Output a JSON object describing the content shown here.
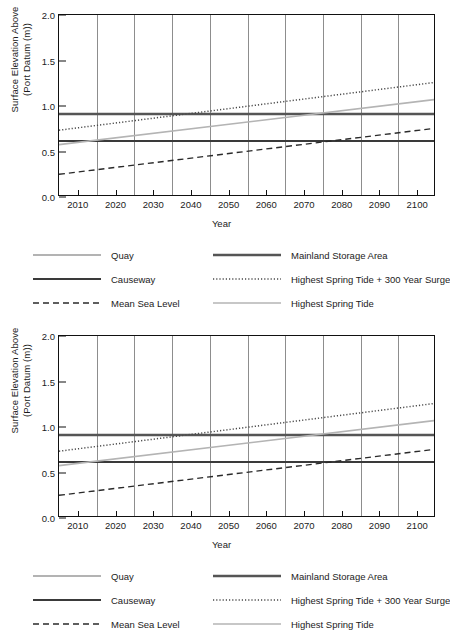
{
  "chart_data": {
    "type": "line",
    "title": "",
    "xlabel": "Year",
    "ylabel": "Surface Elevation Above (Port Datum (m))",
    "ylabel_line1": "Surface Elevation Above",
    "ylabel_line2": "(Port Datum (m))",
    "xlim": [
      2005,
      2105
    ],
    "ylim": [
      0.0,
      2.0
    ],
    "grid": "vertical gridlines at mid-decades",
    "legend_position": "below plot, 3 rows x 2 columns",
    "xticks": [
      2010,
      2020,
      2030,
      2040,
      2050,
      2060,
      2070,
      2080,
      2090,
      2100
    ],
    "xtick_labels": [
      "2010",
      "2020",
      "2030",
      "2040",
      "2050",
      "2060",
      "2070",
      "2080",
      "2090",
      "2100"
    ],
    "yticks": [
      0.0,
      0.5,
      1.0,
      1.5,
      2.0
    ],
    "ytick_labels": [
      "0.0",
      "0.5",
      "1.0",
      "1.5",
      "2.0"
    ],
    "gridlines_x": [
      2015,
      2025,
      2035,
      2045,
      2055,
      2065,
      2075,
      2085,
      2095
    ],
    "series": [
      {
        "name": "Quay",
        "style": "solid",
        "color": "#9a9a9a",
        "width": 1.6,
        "x": [
          2005,
          2105
        ],
        "values": [
          0.9,
          0.9
        ]
      },
      {
        "name": "Mainland Storage Area",
        "style": "solid",
        "color": "#555555",
        "width": 2.4,
        "x": [
          2005,
          2105
        ],
        "values": [
          0.9,
          0.9
        ]
      },
      {
        "name": "Causeway",
        "style": "solid",
        "color": "#3a3a3a",
        "width": 2.0,
        "x": [
          2005,
          2105
        ],
        "values": [
          0.6,
          0.6
        ]
      },
      {
        "name": "Highest Spring Tide + 300 Year Surge",
        "style": "dotted",
        "color": "#4a4a4a",
        "width": 1.5,
        "x": [
          2005,
          2105
        ],
        "values": [
          0.72,
          1.25
        ]
      },
      {
        "name": "Mean Sea Level",
        "style": "dashed",
        "color": "#2a2a2a",
        "width": 1.4,
        "x": [
          2005,
          2105
        ],
        "values": [
          0.23,
          0.74
        ]
      },
      {
        "name": "Highest Spring Tide",
        "style": "solid",
        "color": "#b4b4b4",
        "width": 1.6,
        "x": [
          2005,
          2105
        ],
        "values": [
          0.56,
          1.06
        ]
      }
    ]
  },
  "charts": [
    {
      "id": "chart-top"
    },
    {
      "id": "chart-bottom"
    }
  ],
  "legend": {
    "rows": [
      [
        {
          "label": "Quay",
          "series": "Quay"
        },
        {
          "label": "Mainland Storage Area",
          "series": "Mainland Storage Area"
        }
      ],
      [
        {
          "label": "Causeway",
          "series": "Causeway"
        },
        {
          "label": "Highest Spring Tide + 300 Year Surge",
          "series": "Highest Spring Tide + 300 Year Surge"
        }
      ],
      [
        {
          "label": "Mean Sea Level",
          "series": "Mean Sea Level"
        },
        {
          "label": "Highest Spring Tide",
          "series": "Highest Spring Tide"
        }
      ]
    ]
  },
  "colors": {
    "axis": "#111111",
    "grid": "#8d8d8d",
    "background": "#ffffff"
  }
}
